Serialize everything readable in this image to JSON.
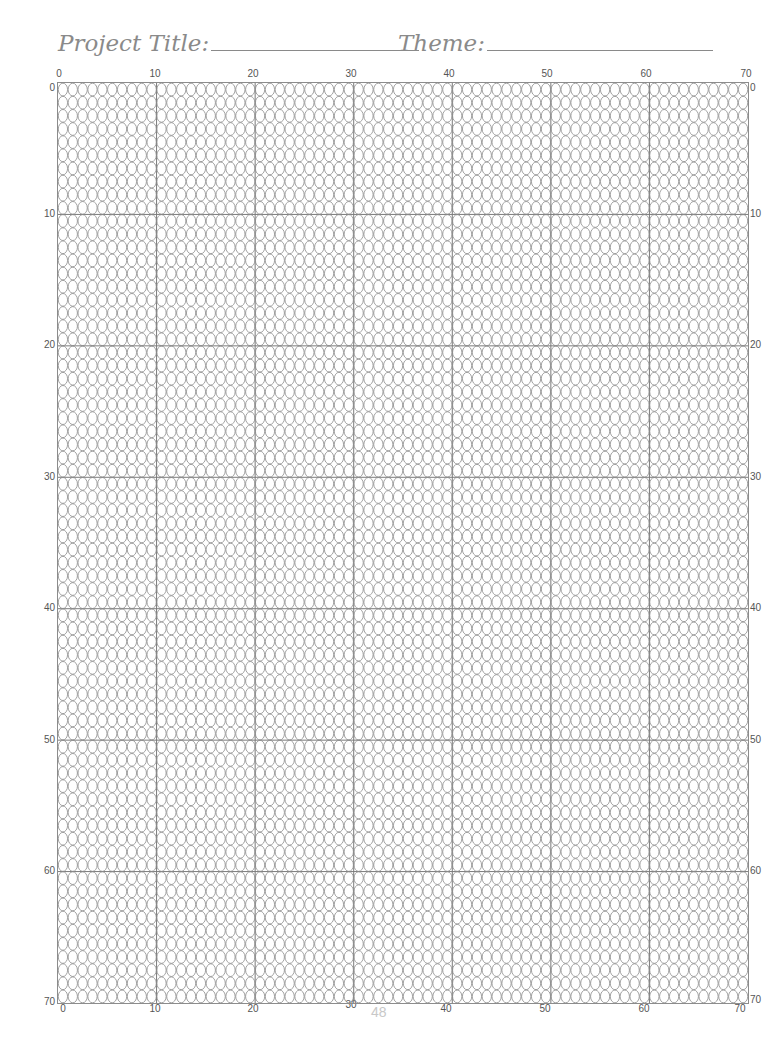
{
  "header": {
    "project_title_label": "Project Title:",
    "theme_label": "Theme:"
  },
  "grid": {
    "columns": 70,
    "rows": 70,
    "major_every": 10,
    "bead_shape": "oval",
    "line_color": "#8c8c8c",
    "major_line_color": "#7a7a7a"
  },
  "axes": {
    "top": [
      "0",
      "10",
      "20",
      "30",
      "40",
      "50",
      "60",
      "70"
    ],
    "bottom": [
      "0",
      "10",
      "20",
      "30",
      "40",
      "50",
      "60",
      "70"
    ],
    "left": [
      "0",
      "10",
      "20",
      "30",
      "40",
      "50",
      "60",
      "70"
    ],
    "right": [
      "0",
      "10",
      "20",
      "30",
      "40",
      "50",
      "60",
      "70"
    ]
  },
  "footer": {
    "page_number": "48"
  }
}
